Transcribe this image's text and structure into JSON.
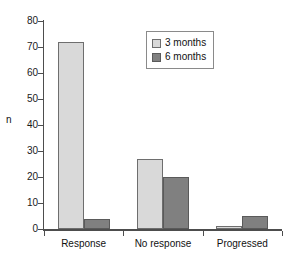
{
  "chart_data": {
    "type": "bar",
    "title": "",
    "subtitle": "",
    "xlabel": "",
    "ylabel": "n",
    "categories": [
      "Response",
      "No response",
      "Progressed"
    ],
    "series": [
      {
        "name": "3 months",
        "color": "#d9d9d9",
        "values": [
          72,
          27,
          1
        ]
      },
      {
        "name": "6 months",
        "color": "#808080",
        "values": [
          4,
          20,
          5
        ]
      }
    ],
    "ylim": [
      0,
      80
    ],
    "ytick_step": 10,
    "yticks": [
      0,
      10,
      20,
      30,
      40,
      50,
      60,
      70,
      80
    ],
    "ytick_labels": [
      "0",
      "10",
      "20",
      "30",
      "40",
      "50",
      "60",
      "70",
      "80"
    ],
    "grid": false,
    "legend_position": "upper-center-right",
    "annotations": []
  },
  "legend": {
    "items": [
      {
        "label": "3 months"
      },
      {
        "label": "6 months"
      }
    ]
  }
}
